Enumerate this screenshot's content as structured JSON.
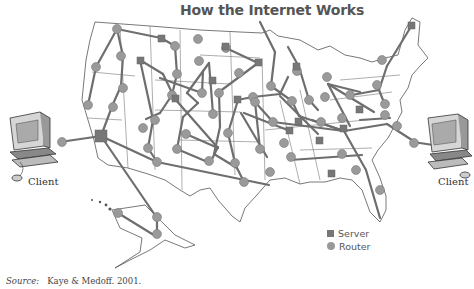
{
  "title": "How the Internet Works",
  "legend": {
    "server_label": "Server",
    "router_label": "Router"
  },
  "clients": {
    "left_label": "Client",
    "right_label": "Client"
  },
  "source": {
    "prefix": "Source:",
    "text": "Kaye & Medoff. 2001."
  },
  "colors": {
    "link": "#6e6e6e",
    "server": "#777777",
    "router": "#9a9a9a",
    "border": "#555555"
  }
}
